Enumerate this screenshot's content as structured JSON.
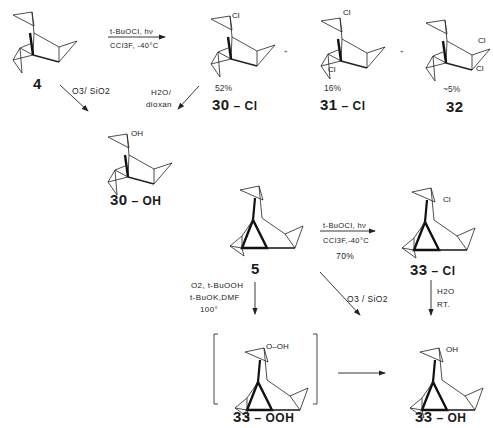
{
  "compounds": {
    "c4": {
      "number": "4",
      "suffix": ""
    },
    "c30cl": {
      "number": "30",
      "suffix": " – Cl",
      "yield": "52%",
      "substituent": "Cl"
    },
    "c31cl": {
      "number": "31",
      "suffix": " – Cl",
      "yield": "16%",
      "substituents": [
        "Cl",
        "Cl"
      ]
    },
    "c32": {
      "number": "32",
      "suffix": "",
      "yield": "~5%",
      "substituents": [
        "Cl",
        "Cl"
      ]
    },
    "c30oh": {
      "number": "30",
      "suffix": " – OH",
      "substituent": "OH"
    },
    "c5": {
      "number": "5",
      "suffix": ""
    },
    "c33cl": {
      "number": "33",
      "suffix": " – Cl",
      "substituent": "Cl"
    },
    "c33ooh": {
      "number": "33",
      "suffix": " – OOH",
      "substituent": "O–OH"
    },
    "c33oh": {
      "number": "33",
      "suffix": " – OH",
      "substituent": "OH"
    }
  },
  "reactions": {
    "r1": {
      "above": "t-BuOCl, hν",
      "below": "CCl3F, -40°C"
    },
    "r2": {
      "line1": "O3/ SiO2"
    },
    "r3": {
      "line1": "H2O/",
      "line2": "dioxan"
    },
    "r4": {
      "above": "t-BuOCl, hν",
      "below": "CCl3F,-40°C",
      "yield": "70%"
    },
    "r5": {
      "line1": "O2, t-BuOOH",
      "line2": "t-BuOK,DMF",
      "line3": "100°"
    },
    "r6": {
      "line1": "O3 / SiO2"
    },
    "r7": {
      "line1": "H2O",
      "line2": "RT."
    }
  },
  "separators": {
    "plus": "+"
  }
}
